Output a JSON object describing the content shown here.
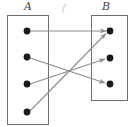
{
  "figure": {
    "type": "function-mapping-diagram",
    "width": 135,
    "height": 127,
    "background_color": "#ffffff"
  },
  "labels": {
    "domain_set": "A",
    "codomain_set": "B",
    "map_name": "f"
  },
  "colors": {
    "box_stroke": "#6e6e6e",
    "arrow_stroke": "#8d8d8d",
    "node_fill": "#1a1a1a",
    "label_text": "#3f3f3f",
    "map_label_text": "#c9c9c9"
  },
  "boxes": [
    {
      "id": "A",
      "label": "A",
      "x": 7,
      "y": 15,
      "width": 42,
      "height": 110
    },
    {
      "id": "B",
      "label": "B",
      "x": 91,
      "y": 15,
      "width": 37,
      "height": 86
    }
  ],
  "nodes": {
    "domain": [
      {
        "id": "a1",
        "cx": 27,
        "cy": 31,
        "r": 3.4
      },
      {
        "id": "a2",
        "cx": 27,
        "cy": 57,
        "r": 3.4
      },
      {
        "id": "a3",
        "cx": 27,
        "cy": 84,
        "r": 3.4
      },
      {
        "id": "a4",
        "cx": 27,
        "cy": 112,
        "r": 3.4
      }
    ],
    "codomain": [
      {
        "id": "b1",
        "cx": 110,
        "cy": 31,
        "r": 3.4
      },
      {
        "id": "b2",
        "cx": 110,
        "cy": 58,
        "r": 3.4
      },
      {
        "id": "b3",
        "cx": 110,
        "cy": 84,
        "r": 3.4
      }
    ]
  },
  "arrows": [
    {
      "id": "arrow-a1-b1",
      "from": "a1",
      "to": "b1",
      "x1": 30,
      "y1": 31,
      "x2": 107,
      "y2": 31
    },
    {
      "id": "arrow-a2-b3",
      "from": "a2",
      "to": "b3",
      "x1": 30,
      "y1": 58,
      "x2": 106,
      "y2": 83
    },
    {
      "id": "arrow-a3-b2",
      "from": "a3",
      "to": "b2",
      "x1": 30,
      "y1": 84,
      "x2": 106,
      "y2": 59
    },
    {
      "id": "arrow-a4-b1",
      "from": "a4",
      "to": "b1",
      "x1": 30,
      "y1": 111,
      "x2": 107,
      "y2": 33
    }
  ],
  "label_positions": {
    "A": {
      "x": 24,
      "y": 1
    },
    "B": {
      "x": 102,
      "y": 1
    },
    "f": {
      "x": 62,
      "y": 3
    }
  }
}
